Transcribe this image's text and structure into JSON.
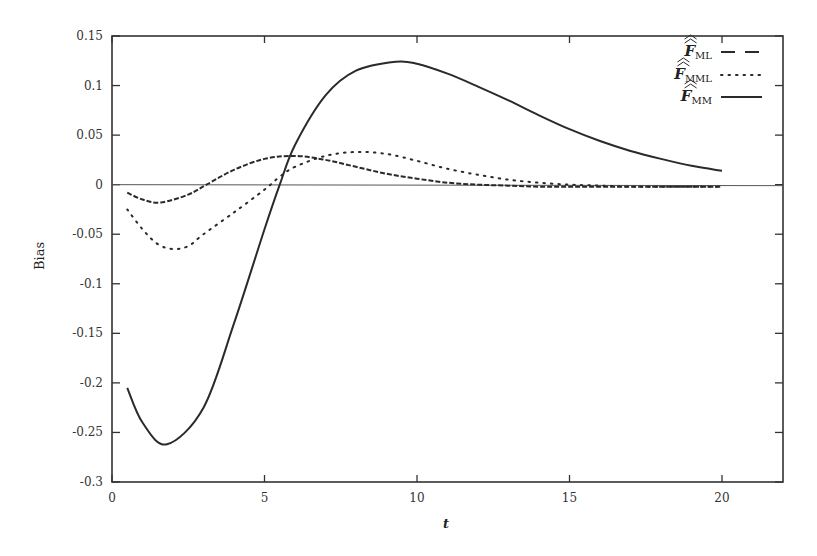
{
  "chart_data": {
    "type": "line",
    "title": "",
    "xlabel": "t",
    "ylabel": "Bias",
    "xlim": [
      0,
      22
    ],
    "ylim": [
      -0.3,
      0.15
    ],
    "xticks": [
      0,
      5,
      10,
      15,
      20
    ],
    "xtick_labels": [
      "0",
      "5",
      "10",
      "15",
      "20"
    ],
    "yticks": [
      0.15,
      0.1,
      0.05,
      0,
      -0.05,
      -0.1,
      -0.15,
      -0.2,
      -0.25,
      -0.3
    ],
    "ytick_labels": [
      "0.15",
      "0.1",
      "0.05",
      "0",
      "-0.05",
      "-0.1",
      "-0.15",
      "-0.2",
      "-0.25",
      "-0.3"
    ],
    "grid": false,
    "zero_line": true,
    "legend_position": "upper right",
    "series": [
      {
        "name": "F̂̂_ML",
        "legend_main": "F",
        "legend_sub": "ML",
        "style": "dashed",
        "x": [
          0.5,
          1,
          1.6,
          2.5,
          3.1,
          4,
          5,
          6,
          7,
          8,
          9,
          10,
          11,
          12,
          13,
          14,
          15,
          16,
          17,
          18,
          19,
          20
        ],
        "y": [
          -0.008,
          -0.015,
          -0.018,
          -0.01,
          0,
          0.015,
          0.026,
          0.029,
          0.025,
          0.018,
          0.011,
          0.006,
          0.002,
          0,
          -0.001,
          -0.002,
          -0.002,
          -0.002,
          -0.002,
          -0.002,
          -0.002,
          -0.002
        ]
      },
      {
        "name": "F̂̂_MML",
        "legend_main": "F",
        "legend_sub": "MML",
        "style": "dotted",
        "x": [
          0.5,
          1,
          1.5,
          2,
          2.5,
          3,
          4,
          5,
          5.5,
          6,
          7,
          8,
          9,
          10,
          11,
          12,
          13,
          14,
          15,
          16,
          17,
          18,
          19,
          20
        ],
        "y": [
          -0.025,
          -0.045,
          -0.06,
          -0.065,
          -0.062,
          -0.05,
          -0.028,
          -0.005,
          0.008,
          0.018,
          0.029,
          0.033,
          0.031,
          0.024,
          0.016,
          0.01,
          0.005,
          0.002,
          0.0,
          -0.001,
          -0.002,
          -0.002,
          -0.002,
          -0.002
        ]
      },
      {
        "name": "F̂̂_MM",
        "legend_main": "F",
        "legend_sub": "MM",
        "style": "solid",
        "x": [
          0.5,
          1,
          1.8,
          3,
          4,
          5,
          5.5,
          6,
          7,
          8,
          9.3,
          10,
          11,
          12,
          13,
          14,
          15,
          16,
          17,
          18,
          19,
          20
        ],
        "y": [
          -0.205,
          -0.24,
          -0.262,
          -0.225,
          -0.14,
          -0.045,
          0,
          0.04,
          0.09,
          0.115,
          0.124,
          0.122,
          0.112,
          0.099,
          0.085,
          0.07,
          0.056,
          0.044,
          0.034,
          0.026,
          0.019,
          0.014
        ]
      }
    ]
  },
  "colors": {
    "line": "#2a2a2a",
    "axis": "#333333",
    "background": "#ffffff"
  }
}
